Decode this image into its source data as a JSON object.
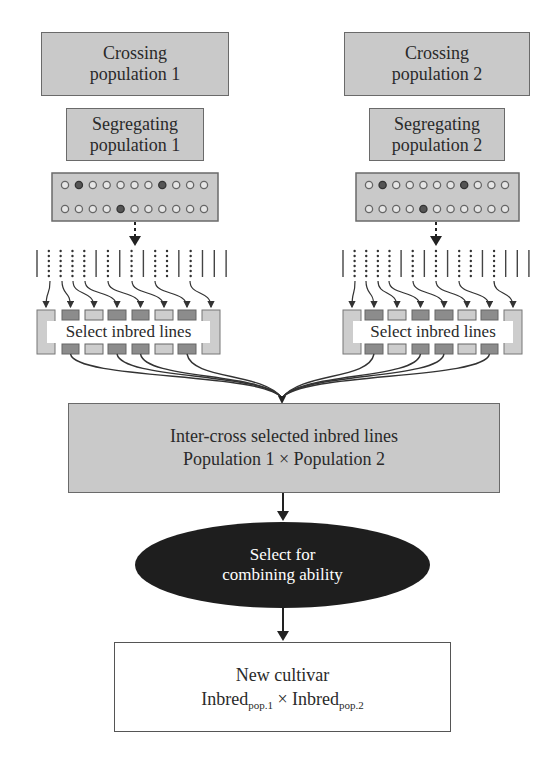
{
  "diagram": {
    "left_branch": {
      "crossing": [
        "Crossing",
        "population 1"
      ],
      "segregating": [
        "Segregating",
        "population 1"
      ],
      "select_label": "Select inbred lines"
    },
    "right_branch": {
      "crossing": [
        "Crossing",
        "population 2"
      ],
      "segregating": [
        "Segregating",
        "population 2"
      ],
      "select_label": "Select inbred lines"
    },
    "intercross": [
      "Inter-cross selected inbred lines",
      "Population 1 × Population 2"
    ],
    "selection": [
      "Select for",
      "combining ability"
    ],
    "result": {
      "line1": "New cultivar",
      "inbred": "Inbred",
      "sub1": "pop.1",
      "times": " × ",
      "sub2": "pop.2"
    },
    "dots": {
      "per_row": 11,
      "left_dark_row1": [
        1,
        7
      ],
      "left_dark_row2": [
        4
      ],
      "right_dark_row1": [
        1,
        7
      ],
      "right_dark_row2": [
        4
      ]
    },
    "line_pattern": [
      "solid",
      "dotted",
      "dotted",
      "dotted",
      "dotted",
      "solid",
      "dotted",
      "solid",
      "dotted",
      "solid",
      "dotted",
      "dotted",
      "solid",
      "dotted",
      "solid",
      "solid",
      "solid"
    ],
    "box_shades": [
      "light",
      "dark",
      "light",
      "dark",
      "dark",
      "light",
      "dark",
      "light"
    ],
    "colors": {
      "box_fill": "#c9c9c9",
      "light_column": "#cdcdcd",
      "dark_column": "#8c8c8c",
      "ellipse_fill": "#1e1e1e",
      "line": "#3a3a3a"
    }
  }
}
